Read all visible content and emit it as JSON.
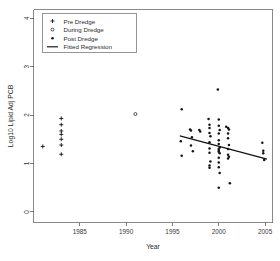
{
  "chart_data": {
    "type": "scatter",
    "title": "",
    "xlabel": "Year",
    "ylabel": "Log10 Lipid Adj PCB",
    "xlim": [
      1980.0,
      2005.8
    ],
    "ylim": [
      -0.22,
      4.18
    ],
    "xticks": [
      1985,
      1990,
      1995,
      2000,
      2005
    ],
    "xticklabels": [
      "1985",
      "1990",
      "1995",
      "2000",
      "2005"
    ],
    "yticks": [
      0,
      1,
      2,
      3,
      4
    ],
    "yticklabels": [
      "0",
      "1",
      "2",
      "3",
      "4"
    ],
    "grid": false,
    "legend_position": "top-left",
    "series": [
      {
        "name": "Pre Dredge",
        "marker": "plus",
        "color": "#141414",
        "points": [
          [
            1981.0,
            1.35
          ],
          [
            1983.0,
            1.93
          ],
          [
            1983.0,
            1.8
          ],
          [
            1983.0,
            1.67
          ],
          [
            1983.0,
            1.6
          ],
          [
            1983.0,
            1.5
          ],
          [
            1983.0,
            1.38
          ],
          [
            1983.0,
            1.19
          ]
        ]
      },
      {
        "name": "During Dredge",
        "marker": "open-circle",
        "color": "#2a2a2a",
        "points": [
          [
            1991.0,
            2.02
          ]
        ]
      },
      {
        "name": "Post Dredge",
        "marker": "filled-circle",
        "color": "#141414",
        "points": [
          [
            1996.0,
            2.12
          ],
          [
            1995.9,
            1.46
          ],
          [
            1996.0,
            1.16
          ],
          [
            1996.9,
            1.7
          ],
          [
            1997.0,
            1.68
          ],
          [
            1997.1,
            1.54
          ],
          [
            1997.0,
            1.37
          ],
          [
            1997.2,
            1.25
          ],
          [
            1997.9,
            1.69
          ],
          [
            1998.0,
            1.66
          ],
          [
            1998.9,
            1.92
          ],
          [
            1999.0,
            1.8
          ],
          [
            1999.0,
            1.73
          ],
          [
            1999.0,
            1.63
          ],
          [
            1999.1,
            1.56
          ],
          [
            1999.0,
            1.44
          ],
          [
            1999.0,
            1.31
          ],
          [
            1999.0,
            1.22
          ],
          [
            1999.1,
            1.04
          ],
          [
            1999.0,
            0.96
          ],
          [
            1999.0,
            0.91
          ],
          [
            1999.9,
            2.53
          ],
          [
            2000.0,
            1.91
          ],
          [
            2000.0,
            1.78
          ],
          [
            2000.1,
            1.69
          ],
          [
            2000.0,
            1.62
          ],
          [
            2000.0,
            1.48
          ],
          [
            2000.0,
            1.4
          ],
          [
            2000.1,
            1.33
          ],
          [
            2000.0,
            1.3
          ],
          [
            2000.0,
            1.26
          ],
          [
            2000.0,
            1.24
          ],
          [
            2000.1,
            1.21
          ],
          [
            2000.0,
            1.12
          ],
          [
            2000.0,
            1.02
          ],
          [
            2000.0,
            0.92
          ],
          [
            2000.1,
            0.8
          ],
          [
            2000.0,
            0.5
          ],
          [
            2000.8,
            1.76
          ],
          [
            2001.0,
            1.73
          ],
          [
            2001.1,
            1.7
          ],
          [
            2001.0,
            1.62
          ],
          [
            2001.0,
            1.52
          ],
          [
            2001.1,
            1.38
          ],
          [
            2001.0,
            1.3
          ],
          [
            2001.0,
            1.18
          ],
          [
            2001.1,
            1.14
          ],
          [
            2001.0,
            1.1
          ],
          [
            2001.2,
            0.59
          ],
          [
            2004.7,
            1.43
          ],
          [
            2004.8,
            1.26
          ],
          [
            2004.8,
            1.21
          ],
          [
            2004.9,
            1.07
          ]
        ]
      }
    ],
    "fit": {
      "name": "Fitted Regression",
      "color": "#111111",
      "x_start": 1995.8,
      "y_start": 1.57,
      "x_end": 2005.2,
      "y_end": 1.09
    }
  },
  "legend": {
    "entries": [
      {
        "label": "Pre Dredge",
        "marker": "plus"
      },
      {
        "label": "During Dredge",
        "marker": "open-circle"
      },
      {
        "label": "Post Dredge",
        "marker": "filled-circle"
      },
      {
        "label": "Fitted Regression",
        "marker": "line"
      }
    ]
  }
}
